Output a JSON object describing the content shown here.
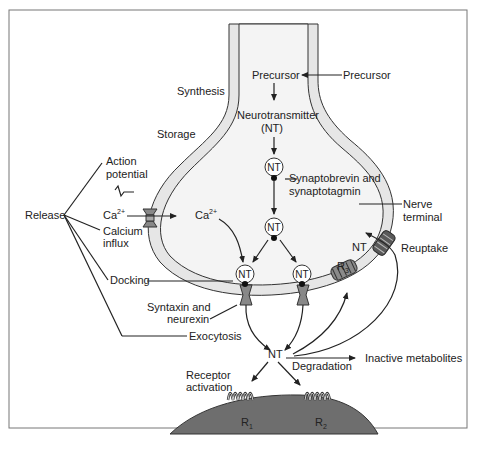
{
  "labels": {
    "synthesis": "Synthesis",
    "storage": "Storage",
    "precursor_inside": "Precursor",
    "precursor_outside": "Precursor",
    "neurotransmitter": "Neurotransmitter",
    "nt_abbrev": "(NT)",
    "nt": "NT",
    "synaptobrevin_1": "Synaptobrevin and",
    "synaptobrevin_2": "synaptotagmin",
    "nerve_terminal_1": "Nerve",
    "nerve_terminal_2": "terminal",
    "action_potential_1": "Action",
    "action_potential_2": "potential",
    "release": "Release",
    "ca": "Ca",
    "ca_sup": "2+",
    "calcium_influx_1": "Calcium",
    "calcium_influx_2": "influx",
    "docking": "Docking",
    "syntaxin_1": "Syntaxin and",
    "syntaxin_2": "neurexin",
    "exocytosis": "Exocytosis",
    "reuptake": "Reuptake",
    "r3": "R",
    "r3_sub": "3",
    "r1": "R",
    "r1_sub": "1",
    "r2": "R",
    "r2_sub": "2",
    "degradation": "Degradation",
    "inactive_metabolites": "Inactive metabolites",
    "receptor_activation_1": "Receptor",
    "receptor_activation_2": "activation"
  },
  "colors": {
    "membrane": "#e6e6e6",
    "membrane_outline": "#333333",
    "cytoplasm": "#f4f4f4",
    "postsynaptic": "#6e6e6e",
    "protein": "#8a8a8a",
    "line": "#222222",
    "frame": "#777777"
  }
}
